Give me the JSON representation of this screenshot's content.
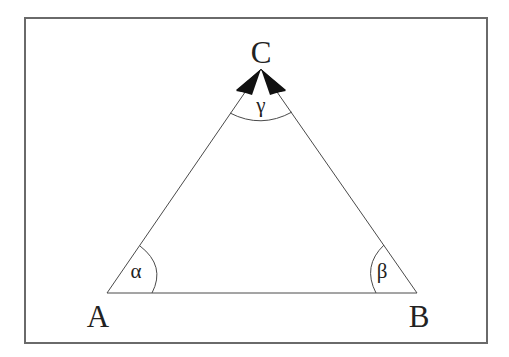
{
  "diagram": {
    "type": "triangle",
    "title": "",
    "colors": {
      "frame": "#6a6a6a",
      "edge": "#4a4a4a",
      "arc": "#4a4a4a",
      "arrowhead": "#111111",
      "text": "#222222",
      "background": "#ffffff"
    },
    "frame": {
      "x": 25,
      "y": 18,
      "width": 462,
      "height": 325
    },
    "vertices": {
      "A": {
        "label": "A",
        "x": 107,
        "y": 293
      },
      "B": {
        "label": "B",
        "x": 417,
        "y": 293
      },
      "C": {
        "label": "C",
        "x": 261,
        "y": 69
      }
    },
    "edges": [
      {
        "from": "A",
        "to": "B"
      },
      {
        "from": "A",
        "to": "C"
      },
      {
        "from": "B",
        "to": "C"
      }
    ],
    "angles": {
      "alpha": {
        "vertex": "A",
        "label": "α"
      },
      "beta": {
        "vertex": "B",
        "label": "β"
      },
      "gamma": {
        "vertex": "C",
        "label": "γ"
      }
    },
    "arrowheads_at": "C"
  }
}
